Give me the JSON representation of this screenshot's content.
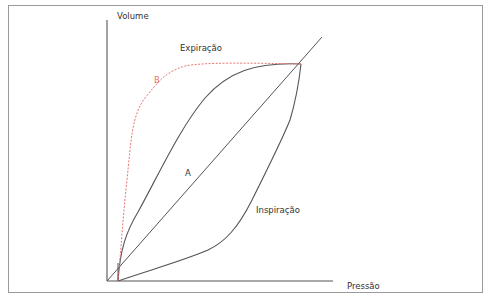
{
  "diagram": {
    "type": "pressure-volume-loop",
    "axes": {
      "y_label": "Volume",
      "x_label": "Pressão"
    },
    "labels": {
      "expiration": "Expiração",
      "inspiration": "Inspiração",
      "curve_a": "A",
      "curve_b": "B"
    },
    "colors": {
      "axis": "#555555",
      "curve": "#555555",
      "curve_b": "#e8766f",
      "frame": "#9a9a9a"
    }
  }
}
